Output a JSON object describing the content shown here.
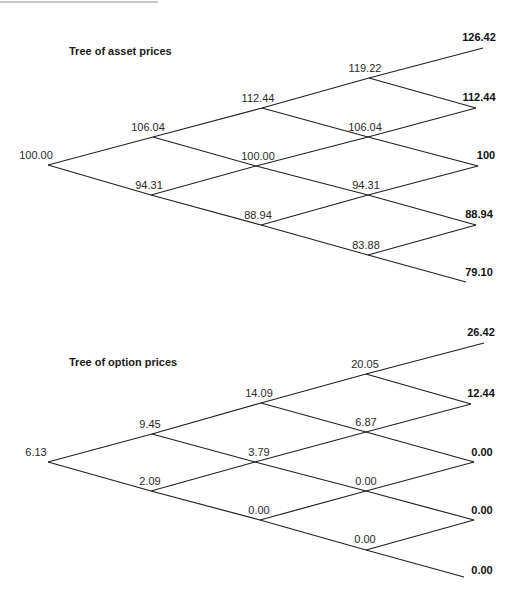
{
  "asset_tree": {
    "title": "Tree of asset prices",
    "nodes": {
      "n00": {
        "label": "100.00",
        "x": 48,
        "y": 165,
        "lx": 36,
        "ly": 149
      },
      "n10": {
        "label": "106.04",
        "x": 153,
        "y": 137,
        "lx": 148,
        "ly": 121
      },
      "n11": {
        "label": "94.31",
        "x": 151,
        "y": 195,
        "lx": 149,
        "ly": 179
      },
      "n20": {
        "label": "112.44",
        "x": 262,
        "y": 108,
        "lx": 258,
        "ly": 92
      },
      "n21": {
        "label": "100.00",
        "x": 256,
        "y": 166,
        "lx": 258,
        "ly": 150
      },
      "n22": {
        "label": "88.94",
        "x": 261,
        "y": 225,
        "lx": 258,
        "ly": 209
      },
      "n30": {
        "label": "119.22",
        "x": 369,
        "y": 78,
        "lx": 365,
        "ly": 62
      },
      "n31": {
        "label": "106.04",
        "x": 368,
        "y": 137,
        "lx": 365,
        "ly": 121
      },
      "n32": {
        "label": "94.31",
        "x": 368,
        "y": 195,
        "lx": 366,
        "ly": 179
      },
      "n33": {
        "label": "83.88",
        "x": 368,
        "y": 255,
        "lx": 366,
        "ly": 239
      },
      "n40": {
        "label": "126.42",
        "x": 483,
        "y": 48,
        "lx": 479,
        "ly": 31,
        "terminal": true
      },
      "n41": {
        "label": "112.44",
        "x": 476,
        "y": 108,
        "lx": 479,
        "ly": 91,
        "terminal": true
      },
      "n42": {
        "label": "100",
        "x": 478,
        "y": 166,
        "lx": 486,
        "ly": 149,
        "terminal": true
      },
      "n43": {
        "label": "88.94",
        "x": 476,
        "y": 225,
        "lx": 479,
        "ly": 208,
        "terminal": true
      },
      "n44": {
        "label": "79.10",
        "x": 466,
        "y": 282,
        "lx": 479,
        "ly": 266,
        "terminal": true
      }
    }
  },
  "option_tree": {
    "title": "Tree of option prices",
    "nodes": {
      "n00": {
        "label": "6.13",
        "x": 48,
        "y": 462,
        "lx": 36,
        "ly": 446
      },
      "n10": {
        "label": "9.45",
        "x": 152,
        "y": 434,
        "lx": 150,
        "ly": 418
      },
      "n11": {
        "label": "2.09",
        "x": 151,
        "y": 491,
        "lx": 150,
        "ly": 475
      },
      "n20": {
        "label": "14.09",
        "x": 261,
        "y": 403,
        "lx": 259,
        "ly": 387
      },
      "n21": {
        "label": "3.79",
        "x": 255,
        "y": 462,
        "lx": 259,
        "ly": 446
      },
      "n22": {
        "label": "0.00",
        "x": 260,
        "y": 520,
        "lx": 259,
        "ly": 504
      },
      "n30": {
        "label": "20.05",
        "x": 366,
        "y": 374,
        "lx": 365,
        "ly": 358
      },
      "n31": {
        "label": "6.87",
        "x": 366,
        "y": 432,
        "lx": 366,
        "ly": 416
      },
      "n32": {
        "label": "0.00",
        "x": 366,
        "y": 491,
        "lx": 366,
        "ly": 475
      },
      "n33": {
        "label": "0.00",
        "x": 366,
        "y": 550,
        "lx": 365,
        "ly": 533
      },
      "n40": {
        "label": "26.42",
        "x": 484,
        "y": 343,
        "lx": 481,
        "ly": 326,
        "terminal": true
      },
      "n41": {
        "label": "12.44",
        "x": 471,
        "y": 404,
        "lx": 481,
        "ly": 387,
        "terminal": true
      },
      "n42": {
        "label": "0.00",
        "x": 474,
        "y": 462,
        "lx": 482,
        "ly": 446,
        "terminal": true
      },
      "n43": {
        "label": "0.00",
        "x": 474,
        "y": 520,
        "lx": 482,
        "ly": 504,
        "terminal": true
      },
      "n44": {
        "label": "0.00",
        "x": 464,
        "y": 577,
        "lx": 482,
        "ly": 564,
        "terminal": true
      }
    }
  },
  "edges": [
    [
      "n00",
      "n10"
    ],
    [
      "n00",
      "n11"
    ],
    [
      "n10",
      "n20"
    ],
    [
      "n10",
      "n21"
    ],
    [
      "n11",
      "n21"
    ],
    [
      "n11",
      "n22"
    ],
    [
      "n20",
      "n30"
    ],
    [
      "n20",
      "n31"
    ],
    [
      "n21",
      "n31"
    ],
    [
      "n21",
      "n32"
    ],
    [
      "n22",
      "n32"
    ],
    [
      "n22",
      "n33"
    ],
    [
      "n30",
      "n40"
    ],
    [
      "n30",
      "n41"
    ],
    [
      "n31",
      "n41"
    ],
    [
      "n31",
      "n42"
    ],
    [
      "n32",
      "n42"
    ],
    [
      "n32",
      "n43"
    ],
    [
      "n33",
      "n43"
    ],
    [
      "n33",
      "n44"
    ]
  ]
}
